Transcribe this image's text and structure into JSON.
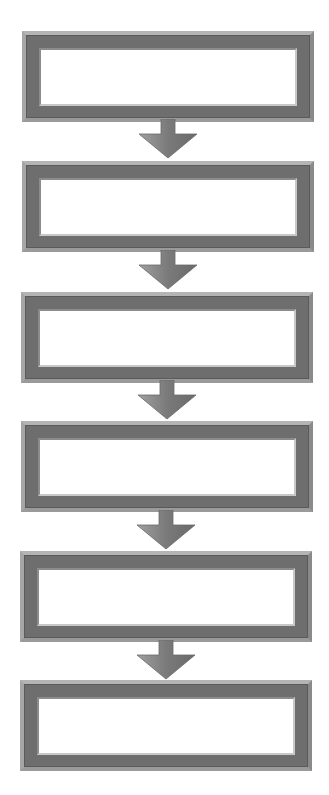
{
  "diagram": {
    "type": "vertical-flowchart",
    "direction": "top-to-bottom",
    "colors": {
      "background": "#ffffff",
      "frame_dark": "#6e6e6e",
      "frame_light": "#b4b4b4",
      "box_interior": "#ffffff",
      "arrow": "#7a7a7a",
      "arrow_highlight": "#a0a0a0"
    },
    "steps": [
      {
        "label": ""
      },
      {
        "label": ""
      },
      {
        "label": ""
      },
      {
        "label": ""
      },
      {
        "label": ""
      },
      {
        "label": ""
      }
    ],
    "connectors": [
      {
        "from": 1,
        "to": 2,
        "icon": "down-arrow-icon"
      },
      {
        "from": 2,
        "to": 3,
        "icon": "down-arrow-icon"
      },
      {
        "from": 3,
        "to": 4,
        "icon": "down-arrow-icon"
      },
      {
        "from": 4,
        "to": 5,
        "icon": "down-arrow-icon"
      },
      {
        "from": 5,
        "to": 6,
        "icon": "down-arrow-icon"
      }
    ]
  }
}
